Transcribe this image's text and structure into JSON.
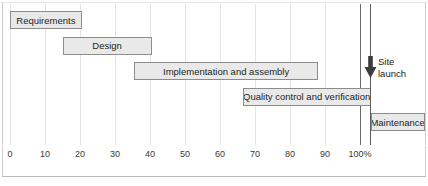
{
  "chart_data": {
    "type": "bar",
    "orientation": "horizontal",
    "subtype": "gantt",
    "title": "",
    "xlabel": "",
    "ylabel": "",
    "xlim": [
      0,
      112
    ],
    "grid": true,
    "legend": "none",
    "axis": {
      "ticks": [
        0,
        10,
        20,
        30,
        40,
        50,
        60,
        70,
        80,
        90,
        100
      ],
      "tick_labels": [
        "0",
        "10",
        "20",
        "30",
        "40",
        "50",
        "60",
        "70",
        "80",
        "90",
        "100%"
      ],
      "unit": "%"
    },
    "tasks": [
      {
        "label": "Requirements",
        "start": 0,
        "end": 20.5,
        "row": 0
      },
      {
        "label": "Design",
        "start": 15,
        "end": 40.5,
        "row": 1
      },
      {
        "label": "Implementation and assembly",
        "start": 35.5,
        "end": 88,
        "row": 2
      },
      {
        "label": "Quality control and verification",
        "start": 66.5,
        "end": 103,
        "row": 3
      },
      {
        "label": "Maintenance",
        "start": 103,
        "end": 118.5,
        "row": 4
      }
    ],
    "milestones": [
      {
        "label_line1": "Site",
        "label_line2": "launch",
        "at": 103,
        "marker": "down-arrow"
      }
    ],
    "colors": {
      "bar_fill": "#e9e9e9",
      "bar_border": "#8c8c8c",
      "gridline": "#e3e3e3",
      "milestone_line": "#5d5d5d",
      "text": "#231f20",
      "background": "#ffffff",
      "frame": "#cfcfcf"
    }
  },
  "figure": {
    "caption": ""
  }
}
